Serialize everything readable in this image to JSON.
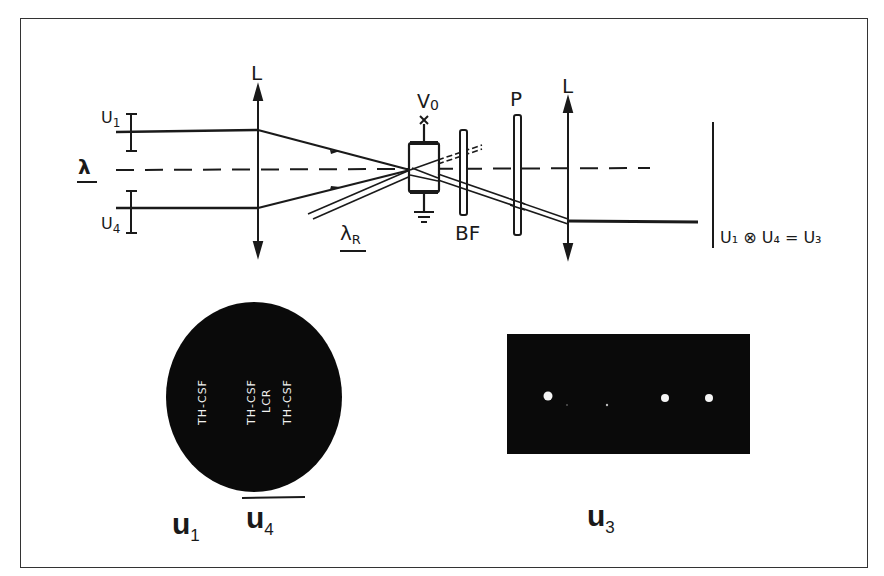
{
  "diagram": {
    "type": "optical-correlator-setup",
    "labels": {
      "lens_left": "L",
      "lens_right": "L",
      "input_top": "U",
      "input_top_sub": "1",
      "input_bottom": "U",
      "input_bottom_sub": "4",
      "wavelength": "λ",
      "readout_wavelength": "λ",
      "readout_wavelength_sub": "R",
      "voltage": "V",
      "voltage_sub": "0",
      "filter": "BF",
      "polarizer": "P",
      "equation": "U₁ ⊗ U₄ = U₃"
    },
    "photos": {
      "mask_caption_left": "u",
      "mask_caption_left_sub": "1",
      "mask_caption_right": "u",
      "mask_caption_right_sub": "4",
      "mask_text_left": "TH-CSF",
      "mask_text_col1": "TH-CSF",
      "mask_text_col2": "LCR",
      "mask_text_col3": "TH-CSF",
      "output_caption": "u",
      "output_caption_sub": "3",
      "output_spots": [
        {
          "x": 548,
          "y": 396,
          "r": 4.5
        },
        {
          "x": 664,
          "y": 398,
          "r": 4
        },
        {
          "x": 709,
          "y": 398,
          "r": 4
        }
      ]
    }
  }
}
